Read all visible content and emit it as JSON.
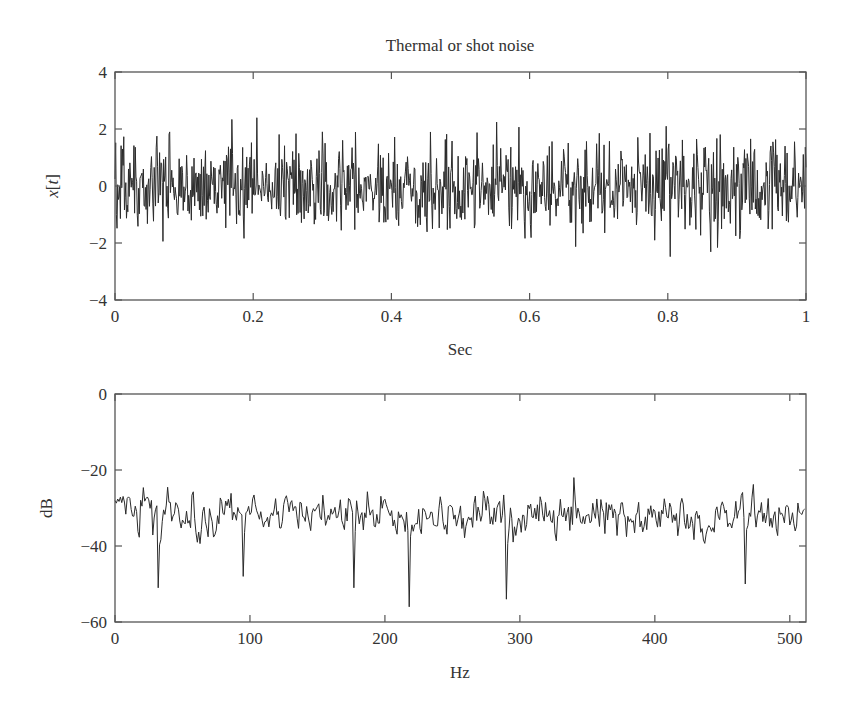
{
  "chart_data": [
    {
      "type": "line",
      "title": "Thermal or shot noise",
      "xlabel": "Sec",
      "ylabel": "x[t]",
      "xlim": [
        0,
        1
      ],
      "ylim": [
        -4,
        4
      ],
      "xticks": [
        0,
        0.2,
        0.4,
        0.6,
        0.8,
        1
      ],
      "xtick_labels": [
        "0",
        "0.2",
        "0.4",
        "0.6",
        "0.8",
        "1"
      ],
      "yticks": [
        -4,
        -2,
        0,
        2,
        4
      ],
      "ytick_labels": [
        "−4",
        "−2",
        "0",
        "2",
        "4"
      ],
      "grid": false,
      "series": [
        {
          "name": "x[t]",
          "description": "White Gaussian noise, ~1024 samples over 1 s, zero mean, std ~0.8, peaks to about +2.6 and -2.7",
          "n_points": 1024,
          "mean": 0,
          "std": 0.8,
          "max": 2.6,
          "min": -2.7,
          "seed": 7
        }
      ]
    },
    {
      "type": "line",
      "title": "",
      "xlabel": "Hz",
      "ylabel": "dB",
      "xlim": [
        0,
        512
      ],
      "ylim": [
        -60,
        0
      ],
      "xticks": [
        0,
        100,
        200,
        300,
        400,
        500
      ],
      "xtick_labels": [
        "0",
        "100",
        "200",
        "300",
        "400",
        "500"
      ],
      "yticks": [
        -60,
        -40,
        -20,
        0
      ],
      "ytick_labels": [
        "−60",
        "−40",
        "−20",
        "0"
      ],
      "grid": false,
      "series": [
        {
          "name": "spectrum",
          "description": "Flat noise spectrum around -32 dB fluctuating between about -22 and -40 dB, with deep dips near 32 Hz (-51), 95 Hz (-48), 177 Hz (-51), 218 Hz (-56), 290 Hz (-54), 467 Hz (-50)",
          "n_points": 512,
          "mean_db": -32,
          "spread_db": 4,
          "max_db": -22,
          "dips": [
            [
              32,
              -51
            ],
            [
              95,
              -48
            ],
            [
              177,
              -51
            ],
            [
              218,
              -56
            ],
            [
              290,
              -54
            ],
            [
              467,
              -50
            ],
            [
              340,
              -22
            ]
          ],
          "seed": 11
        }
      ]
    }
  ],
  "labels": {
    "title": "Thermal or shot noise",
    "top_xlabel": "Sec",
    "top_ylabel": "x[t]",
    "bottom_xlabel": "Hz",
    "bottom_ylabel": "dB"
  },
  "colors": {
    "trace": "#2b2b2b",
    "axes": "#555555",
    "background": "#ffffff"
  }
}
